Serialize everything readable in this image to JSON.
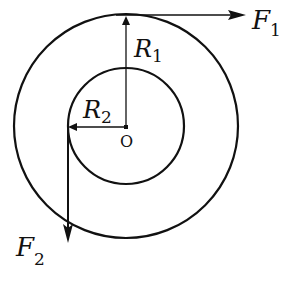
{
  "diagram": {
    "type": "concentric wheel-and-axle force diagram",
    "center_label": "O",
    "outer_circle": {
      "radius_label": "R",
      "radius_sub": "1"
    },
    "inner_circle": {
      "radius_label": "R",
      "radius_sub": "2"
    },
    "forces": [
      {
        "label": "F",
        "sub": "1",
        "direction": "right",
        "applied_at": "top of outer circle"
      },
      {
        "label": "F",
        "sub": "2",
        "direction": "down",
        "applied_at": "left of inner circle"
      }
    ],
    "stroke_color": "#111111",
    "background": "#ffffff"
  }
}
